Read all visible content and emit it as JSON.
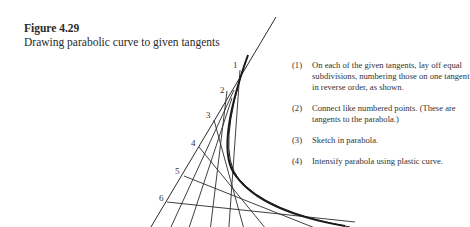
{
  "figure": {
    "number": "Figure 4.29",
    "caption": "Drawing parabolic curve to given tangents"
  },
  "steps": [
    {
      "num": "(1)",
      "text": "On each of the given tangents, lay off equal subdivisions, numbering those on one tangent in reverse order, as shown."
    },
    {
      "num": "(2)",
      "text": "Connect like numbered points. (These are tangents to the parabola.)"
    },
    {
      "num": "(3)",
      "text": "Sketch in parabola."
    },
    {
      "num": "(4)",
      "text": "Intensify parabola using plastic curve."
    }
  ],
  "diagram": {
    "labels": [
      "1",
      "2",
      "3",
      "4",
      "5",
      "6"
    ],
    "line_color": "#2a2a2a",
    "curve_color": "#1a1a1a"
  }
}
